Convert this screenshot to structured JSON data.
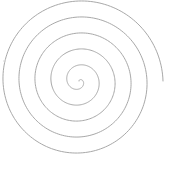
{
  "diagram": {
    "type": "archimedean-spiral",
    "canvas": {
      "width": 174,
      "height": 170,
      "background": "#ffffff"
    },
    "spiral": {
      "center": [
        79,
        81
      ],
      "outer_radius": 84,
      "turns": 5.25,
      "end_angle_deg": 0,
      "direction": "clockwise-outward-ending-at-right",
      "stroke": "#a8a8a8",
      "stroke_width": 1
    },
    "artifacts": [
      {
        "shape": "dash",
        "x": 3,
        "y": 61,
        "length": 3,
        "color": "#d8d8d8"
      }
    ]
  }
}
